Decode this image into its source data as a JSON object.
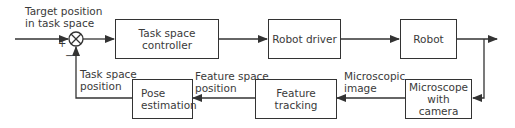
{
  "diagram": {
    "input_label": "Target position\nin task space",
    "input_label_lines": [
      "Target position",
      "in task space"
    ],
    "summing_junction": {
      "plus": "+",
      "minus": "−",
      "icon": "summing-junction-icon"
    },
    "blocks": {
      "task_space_controller": {
        "lines": [
          "Task space",
          "controller"
        ]
      },
      "robot_driver": {
        "lines": [
          "Robot driver"
        ]
      },
      "robot": {
        "lines": [
          "Robot"
        ]
      },
      "microscope": {
        "lines": [
          "Microscope",
          "with camera"
        ]
      },
      "feature_tracking": {
        "lines": [
          "Feature tracking"
        ]
      },
      "pose_estimation": {
        "lines": [
          "Pose",
          "estimation"
        ]
      }
    },
    "signals": {
      "microscopic_image": [
        "Microscopic",
        "image"
      ],
      "feature_space_position": [
        "Feature space",
        "position"
      ],
      "task_space_position": [
        "Task space",
        "position"
      ]
    },
    "colors": {
      "line": "#333333",
      "text": "#3a3a3a",
      "background": "#ffffff"
    }
  }
}
